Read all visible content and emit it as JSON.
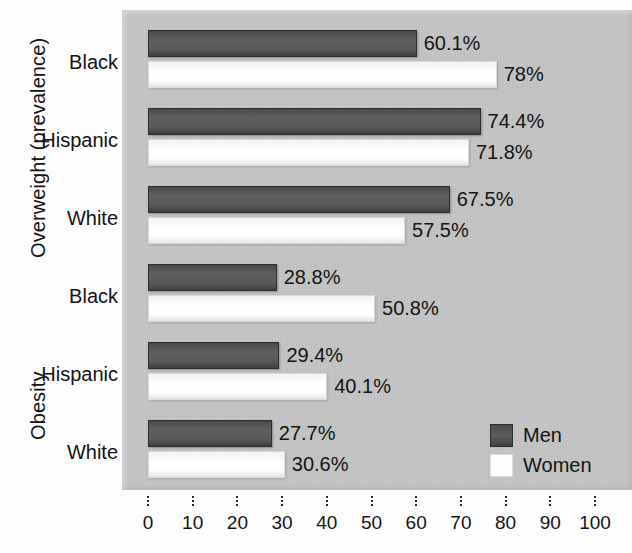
{
  "chart_data": {
    "type": "bar",
    "orientation": "horizontal",
    "title": "",
    "xlabel": "",
    "ylabel": "",
    "xlim": [
      0,
      100
    ],
    "xticks": [
      0,
      10,
      20,
      30,
      40,
      50,
      60,
      70,
      80,
      90,
      100
    ],
    "grid": false,
    "legend_position": "inside-bottom-right",
    "legend": [
      "Men",
      "Women"
    ],
    "series": [
      {
        "name": "Men",
        "color": "#585858",
        "values": [
          60.1,
          74.4,
          67.5,
          28.8,
          29.4,
          27.7
        ]
      },
      {
        "name": "Women",
        "color": "#fdfdfd",
        "values": [
          78.0,
          71.8,
          57.5,
          50.8,
          40.1,
          30.6
        ]
      }
    ],
    "categories": [
      "Black",
      "Hispanic",
      "White",
      "Black",
      "Hispanic",
      "White"
    ],
    "groups": [
      {
        "label": "Overweight (prevalence)",
        "categories": [
          "Black",
          "Hispanic",
          "White"
        ],
        "men": [
          60.1,
          74.4,
          67.5
        ],
        "women": [
          78.0,
          71.8,
          57.5
        ]
      },
      {
        "label": "Obesity",
        "categories": [
          "Black",
          "Hispanic",
          "White"
        ],
        "men": [
          28.8,
          29.4,
          27.7
        ],
        "women": [
          50.8,
          40.1,
          30.6
        ]
      }
    ],
    "bars": [
      {
        "group": "Overweight (prevalence)",
        "category": "Black",
        "series": "Men",
        "value": 60.1,
        "label": "60.1%"
      },
      {
        "group": "Overweight (prevalence)",
        "category": "Black",
        "series": "Women",
        "value": 78.0,
        "label": "78%"
      },
      {
        "group": "Overweight (prevalence)",
        "category": "Hispanic",
        "series": "Men",
        "value": 74.4,
        "label": "74.4%"
      },
      {
        "group": "Overweight (prevalence)",
        "category": "Hispanic",
        "series": "Women",
        "value": 71.8,
        "label": "71.8%"
      },
      {
        "group": "Overweight (prevalence)",
        "category": "White",
        "series": "Men",
        "value": 67.5,
        "label": "67.5%"
      },
      {
        "group": "Overweight (prevalence)",
        "category": "White",
        "series": "Women",
        "value": 57.5,
        "label": "57.5%"
      },
      {
        "group": "Obesity",
        "category": "Black",
        "series": "Men",
        "value": 28.8,
        "label": "28.8%"
      },
      {
        "group": "Obesity",
        "category": "Black",
        "series": "Women",
        "value": 50.8,
        "label": "50.8%"
      },
      {
        "group": "Obesity",
        "category": "Hispanic",
        "series": "Men",
        "value": 29.4,
        "label": "29.4%"
      },
      {
        "group": "Obesity",
        "category": "Hispanic",
        "series": "Women",
        "value": 40.1,
        "label": "40.1%"
      },
      {
        "group": "Obesity",
        "category": "White",
        "series": "Men",
        "value": 27.7,
        "label": "27.7%"
      },
      {
        "group": "Obesity",
        "category": "White",
        "series": "Women",
        "value": 30.6,
        "label": "30.6%"
      }
    ]
  },
  "axis_titles": {
    "overweight": "Overweight (prevalence)",
    "obesity": "Obesity"
  },
  "category_labels": [
    "Black",
    "Hispanic",
    "White",
    "Black",
    "Hispanic",
    "White"
  ],
  "tick_labels": [
    "0",
    "10",
    "20",
    "30",
    "40",
    "50",
    "60",
    "70",
    "80",
    "90",
    "100"
  ],
  "legend": {
    "men_label": "Men",
    "women_label": "Women"
  },
  "colors": {
    "panel": "#c3c3c3",
    "men_bar": "#585858",
    "women_bar": "#fdfdfd",
    "text": "#141414"
  }
}
